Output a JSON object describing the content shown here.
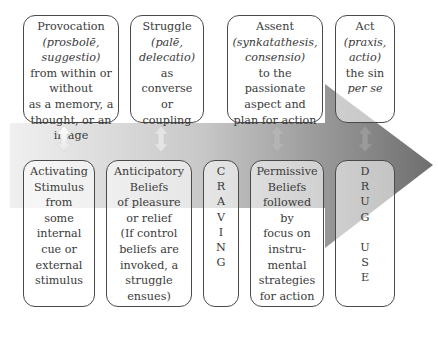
{
  "diagram": {
    "type": "process-arrow",
    "arrow_color_start": "#f2f2f2",
    "arrow_color_end": "#707070",
    "top_row": [
      {
        "id": "provocation",
        "lines": [
          "Provocation",
          "(prosbolē,",
          "suggestio)",
          "from within or",
          "without",
          "as a memory, a",
          "thought, or an",
          "image"
        ],
        "italic_lines": [
          1,
          2
        ]
      },
      {
        "id": "struggle",
        "lines": [
          "Struggle",
          "(palē,",
          "delecatio)",
          "as",
          "converse",
          "or",
          "coupling"
        ],
        "italic_lines": [
          1,
          2
        ]
      },
      {
        "id": "assent",
        "lines": [
          "Assent",
          "(synkatathesis,",
          "consensio)",
          "to the",
          "passionate",
          "aspect and",
          "plan for action"
        ],
        "italic_lines": [
          1,
          2
        ]
      },
      {
        "id": "act",
        "lines": [
          "Act",
          "(praxis,",
          "actio)",
          "the sin",
          "per se"
        ],
        "italic_lines": [
          1,
          2,
          4
        ]
      }
    ],
    "bottom_row": [
      {
        "id": "activating-stimulus",
        "lines": [
          "Activating",
          "Stimulus",
          "from",
          "some",
          "internal",
          "cue or",
          "external",
          "stimulus"
        ]
      },
      {
        "id": "anticipatory-beliefs",
        "lines": [
          "Anticipatory",
          "Beliefs",
          "of pleasure",
          "or relief",
          "(If control",
          "beliefs are",
          "invoked, a",
          "struggle",
          "ensues)"
        ]
      },
      {
        "id": "craving",
        "lines": [
          "C",
          "R",
          "A",
          "V",
          "I",
          "N",
          "G"
        ]
      },
      {
        "id": "permissive-beliefs",
        "lines": [
          "Permissive",
          "Beliefs",
          "followed",
          "by",
          "focus on",
          "instru-",
          "mental",
          "strategies",
          "for action"
        ]
      },
      {
        "id": "drug-use",
        "lines": [
          "D",
          "R",
          "U",
          "G",
          "",
          "U",
          "S",
          "E"
        ]
      }
    ],
    "connectors": [
      "double-arrow",
      "double-arrow",
      "double-arrow",
      "double-arrow"
    ]
  }
}
